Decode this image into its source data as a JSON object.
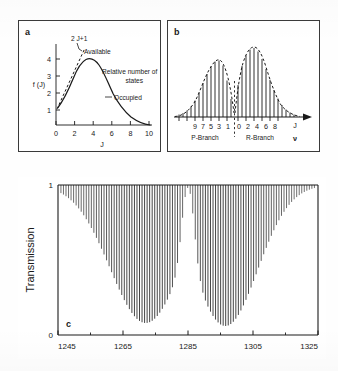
{
  "figure": {
    "panels": [
      "a",
      "b",
      "c"
    ]
  },
  "panel_a": {
    "letter": "a",
    "ylabel": "f (J)",
    "xlabel": "J",
    "xticks": [
      "0",
      "2",
      "4",
      "6",
      "8",
      "10"
    ],
    "yticks": [
      "1",
      "2",
      "3",
      "4"
    ],
    "annotations": {
      "degeneracy": "2 J+1",
      "available": "Available",
      "relative": "Relative number of",
      "relative2": "states",
      "occupied": "Occupied"
    },
    "chart_data": {
      "type": "line",
      "title": "",
      "xlabel": "J",
      "ylabel": "f (J)",
      "xlim": [
        0,
        10.6
      ],
      "ylim": [
        0,
        4.6
      ],
      "grid": false,
      "legend_position": "inline-annotations",
      "series": [
        {
          "name": "Occupied",
          "style": "solid",
          "x": [
            0,
            0.25,
            0.5,
            0.75,
            1,
            1.25,
            1.5,
            1.75,
            2,
            2.25,
            2.5,
            2.75,
            3,
            3.25,
            3.5,
            4,
            4.5,
            5,
            5.5,
            6,
            6.5,
            7,
            7.5,
            8,
            8.5,
            9,
            9.5,
            10
          ],
          "values": [
            1.05,
            1.35,
            1.75,
            2.15,
            2.55,
            2.95,
            3.3,
            3.6,
            3.8,
            3.9,
            3.92,
            3.88,
            3.78,
            3.6,
            3.38,
            2.85,
            2.3,
            1.8,
            1.38,
            1.05,
            0.8,
            0.6,
            0.45,
            0.35,
            0.27,
            0.2,
            0.14,
            0.08
          ]
        },
        {
          "name": "2 J+1 Available",
          "style": "dashed",
          "x": [
            0,
            0.5,
            1,
            1.5,
            2,
            2.3
          ],
          "values": [
            1.0,
            1.8,
            2.6,
            3.35,
            4.1,
            4.5
          ]
        }
      ]
    }
  },
  "panel_b": {
    "letter": "b",
    "axis_symbol_j": "J",
    "axis_symbol_nu": "ν",
    "branch_p": "P-Branch",
    "branch_r": "R-Branch",
    "p_ticklabels": [
      "9",
      "7",
      "5",
      "3",
      "1"
    ],
    "r_ticklabels": [
      "0",
      "2",
      "4",
      "6",
      "8"
    ],
    "chart_data": {
      "type": "bar",
      "title": "",
      "xlabel": "ν",
      "ylabel": "",
      "grid": false,
      "legend_position": "none",
      "description": "Stick spectrum of P-branch and R-branch line intensities under dashed Boltzmann envelopes, separated by the band origin",
      "series": [
        {
          "name": "P-Branch",
          "categories": [
            "13",
            "12",
            "11",
            "10",
            "9",
            "8",
            "7",
            "6",
            "5",
            "4",
            "3",
            "2",
            "1"
          ],
          "values": [
            0.03,
            0.06,
            0.1,
            0.17,
            0.27,
            0.4,
            0.56,
            0.72,
            0.86,
            0.95,
            0.97,
            0.88,
            0.62
          ]
        },
        {
          "name": "R-Branch",
          "categories": [
            "0",
            "1",
            "2",
            "3",
            "4",
            "5",
            "6",
            "7",
            "8",
            "9",
            "10",
            "11",
            "12"
          ],
          "values": [
            0.55,
            0.85,
            1.05,
            1.18,
            1.2,
            1.12,
            0.98,
            0.8,
            0.6,
            0.43,
            0.28,
            0.17,
            0.09
          ]
        }
      ],
      "envelope": "dashed"
    }
  },
  "panel_c": {
    "letter": "c",
    "ylabel": "Transmission",
    "yticks": [
      "1",
      "0"
    ],
    "xticks": [
      "1245",
      "1265",
      "1285",
      "1305",
      "1325"
    ],
    "chart_data": {
      "type": "line",
      "title": "",
      "xlabel": "",
      "ylabel": "Transmission",
      "xlim": [
        1245,
        1325
      ],
      "ylim": [
        0,
        1
      ],
      "grid": false,
      "legend_position": "none",
      "description": "High-resolution absorption stick spectrum: transmission drops from 1 at each rovibrational line, forming two deep envelopes (P and R branches) with a gap at the band centre near 1285 cm-1",
      "xtick_values": [
        1245,
        1265,
        1285,
        1305,
        1325
      ],
      "minor_ticks": [
        1255,
        1275,
        1295,
        1315
      ],
      "line_spacing_cm1": 0.78,
      "branch_minima": [
        {
          "branch": "P",
          "center_cm1": 1272.0,
          "min_transmission": 0.08
        },
        {
          "branch": "R",
          "center_cm1": 1296.5,
          "min_transmission": 0.06
        }
      ],
      "band_centre_cm1": 1285.0
    }
  },
  "colors": {
    "ink": "#1a1a1a",
    "frame": "#3a3a3a",
    "paper": "#ffffff"
  }
}
